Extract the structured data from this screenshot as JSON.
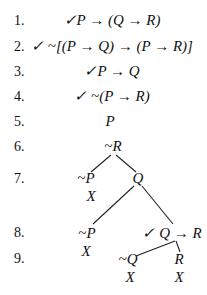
{
  "proof": {
    "lines": [
      {
        "num": "1.",
        "formula": "✓P → (Q → R)"
      },
      {
        "num": "2.",
        "formula": "✓ ~[(P → Q) → (P → R)]"
      },
      {
        "num": "3.",
        "formula": "✓P → Q"
      },
      {
        "num": "4.",
        "formula": "✓ ~(P → R)"
      },
      {
        "num": "5.",
        "formula": "P"
      },
      {
        "num": "6.",
        "formula": "~R"
      },
      {
        "num": "7.",
        "formula": ""
      },
      {
        "num": "8.",
        "formula": ""
      },
      {
        "num": "9.",
        "formula": ""
      }
    ],
    "branches": {
      "line7_left": "~P",
      "line7_left_close": "X",
      "line7_right": "Q",
      "line8_left": "~P",
      "line8_left_close": "X",
      "line8_right": "✓ Q → R",
      "line9_left": "~Q",
      "line9_left_close": "X",
      "line9_right": "R",
      "line9_right_close": "X"
    }
  }
}
